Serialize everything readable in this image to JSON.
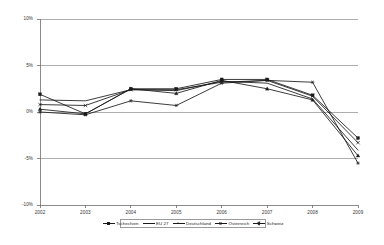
{
  "chart_data": {
    "type": "line",
    "title": "",
    "xlabel": "",
    "ylabel": "",
    "categories": [
      "2002",
      "2003",
      "2004",
      "2005",
      "2006",
      "2007",
      "2008",
      "2009"
    ],
    "ytick_labels": [
      "10%",
      "5%",
      "0%",
      "-5%",
      "-10%"
    ],
    "ytick_values": [
      10,
      5,
      0,
      -5,
      -10
    ],
    "ylim": [
      -10,
      10
    ],
    "grid": true,
    "legend_position": "bottom",
    "series": [
      {
        "name": "Tschechien",
        "marker": "square",
        "values": [
          1.9,
          -0.2,
          2.5,
          2.5,
          3.5,
          3.5,
          1.8,
          -2.8
        ]
      },
      {
        "name": "EU 27",
        "marker": "none",
        "values": [
          1.3,
          1.2,
          2.4,
          2.3,
          3.3,
          3.1,
          1.4,
          -4.1
        ]
      },
      {
        "name": "Deutschland",
        "marker": "triangle",
        "values": [
          0.3,
          -0.2,
          2.5,
          2.0,
          3.4,
          2.5,
          1.3,
          -4.7
        ]
      },
      {
        "name": "Österreich",
        "marker": "cross",
        "values": [
          0.8,
          0.7,
          2.4,
          2.4,
          3.2,
          3.4,
          1.7,
          -3.3
        ]
      },
      {
        "name": "Schweiz",
        "marker": "star",
        "values": [
          0.0,
          -0.3,
          1.2,
          0.7,
          3.1,
          3.4,
          3.2,
          -5.5
        ]
      }
    ]
  },
  "axis": {
    "y_labels": [
      "10%",
      "5%",
      "0%",
      "-5%",
      "-10%"
    ],
    "x_labels": [
      "2002",
      "2003",
      "2004",
      "2005",
      "2006",
      "2007",
      "2008",
      "2009"
    ]
  },
  "legend": {
    "items": [
      {
        "label": "Tschechien",
        "key": "square"
      },
      {
        "label": "EU 27",
        "key": "plain"
      },
      {
        "label": "Deutschland",
        "key": "triangle"
      },
      {
        "label": "Österreich",
        "key": "cross"
      },
      {
        "label": "Schweiz",
        "key": "star"
      }
    ]
  },
  "colors": {
    "line": "#1a1a1a",
    "grid": "#8c8c8c",
    "axis": "#6e6e6e",
    "text": "#333333",
    "background": "#ffffff"
  }
}
